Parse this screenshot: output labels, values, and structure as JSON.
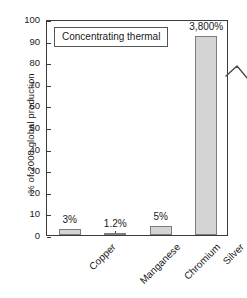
{
  "chart_data": {
    "type": "bar",
    "title": "",
    "subtitle": "",
    "xlabel": "",
    "ylabel": "% of 2008 global production",
    "ylim": [
      0,
      100
    ],
    "yticks": [
      "0",
      "10",
      "20",
      "30",
      "40",
      "50",
      "60",
      "70",
      "80",
      "90",
      "100"
    ],
    "grid": false,
    "legend_position": "top-left-inside",
    "categories": [
      "Copper",
      "Manganese",
      "Chromium",
      "Silver"
    ],
    "values": [
      3,
      1.2,
      5,
      3800
    ],
    "plotted_values": [
      2.6,
      1.0,
      4.0,
      92
    ],
    "value_labels": [
      "3%",
      "1.2%",
      "5%",
      "3,800%"
    ],
    "series": [
      {
        "name": "Concentrating thermal",
        "values": [
          3,
          1.2,
          5,
          3800
        ],
        "color": "#d4d4d4",
        "edge_color": "#7d7d7d"
      }
    ],
    "annotations": [
      {
        "name": "axis-break",
        "text": "",
        "description": "zigzag break mark across Silver bar indicating truncated axis",
        "category": "Silver"
      }
    ],
    "legend_entries": [
      "Concentrating thermal"
    ]
  },
  "legend": {
    "label": "Concentrating thermal"
  },
  "axes": {
    "y_title": "% of 2008 global production",
    "ticks": [
      {
        "label": "100",
        "value": 100
      },
      {
        "label": "90",
        "value": 90
      },
      {
        "label": "80",
        "value": 80
      },
      {
        "label": "70",
        "value": 70
      },
      {
        "label": "60",
        "value": 60
      },
      {
        "label": "50",
        "value": 50
      },
      {
        "label": "40",
        "value": 40
      },
      {
        "label": "30",
        "value": 30
      },
      {
        "label": "20",
        "value": 20
      },
      {
        "label": "10",
        "value": 10
      },
      {
        "label": "0",
        "value": 0
      }
    ]
  },
  "bars": [
    {
      "category": "Copper",
      "label": "3%",
      "plotted": 2.6
    },
    {
      "category": "Manganese",
      "label": "1.2%",
      "plotted": 1.0
    },
    {
      "category": "Chromium",
      "label": "5%",
      "plotted": 4.0
    },
    {
      "category": "Silver",
      "label": "3,800%",
      "plotted": 92
    }
  ],
  "colors": {
    "bar_fill": "#d4d4d4",
    "bar_edge": "#7d7d7d",
    "axis": "#3b3b3b",
    "text": "#1a1a1a",
    "background": "#ffffff"
  }
}
